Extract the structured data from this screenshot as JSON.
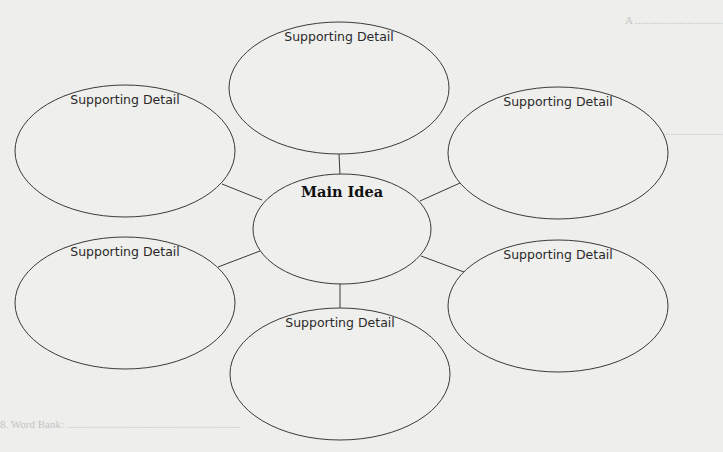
{
  "diagram": {
    "type": "web-graphic-organizer",
    "main_idea": {
      "label": "Main Idea",
      "cx": 342,
      "cy": 229,
      "rx": 89,
      "ry": 55
    },
    "supporting_details": [
      {
        "id": "top",
        "label": "Supporting Detail",
        "cx": 339,
        "cy": 88,
        "rx": 110,
        "ry": 66
      },
      {
        "id": "top-left",
        "label": "Supporting Detail",
        "cx": 125,
        "cy": 151,
        "rx": 110,
        "ry": 66
      },
      {
        "id": "top-right",
        "label": "Supporting Detail",
        "cx": 558,
        "cy": 153,
        "rx": 110,
        "ry": 66
      },
      {
        "id": "bottom-left",
        "label": "Supporting Detail",
        "cx": 125,
        "cy": 303,
        "rx": 110,
        "ry": 66
      },
      {
        "id": "bottom-right",
        "label": "Supporting Detail",
        "cx": 558,
        "cy": 306,
        "rx": 110,
        "ry": 66
      },
      {
        "id": "bottom",
        "label": "Supporting Detail",
        "cx": 340,
        "cy": 374,
        "rx": 110,
        "ry": 66
      }
    ],
    "colors": {
      "stroke": "#3a3a3a",
      "paper": "#eeeeec"
    }
  },
  "background_bleed_text": [
    {
      "text": "A  ................................",
      "x": 625,
      "y": 14
    },
    {
      "text": "B  ................................",
      "x": 625,
      "y": 125
    },
    {
      "text": "8. Word Bank: ...............................................................",
      "x": 0,
      "y": 418
    }
  ]
}
